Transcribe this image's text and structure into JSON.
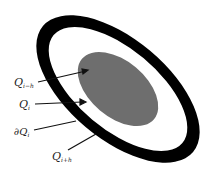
{
  "diagram": {
    "regions": [
      {
        "name": "outer-ring",
        "fill": "#000000",
        "description": "black annulus"
      },
      {
        "name": "white-band",
        "fill": "#ffffff"
      },
      {
        "name": "inner-ellipse",
        "fill": "#6e6e6e"
      }
    ],
    "labels": [
      {
        "id": "q-i-minus-h",
        "base": "Q",
        "sub": "i−h"
      },
      {
        "id": "q-i",
        "base": "Q",
        "sub": "i"
      },
      {
        "id": "boundary-q-i",
        "base": "∂Q",
        "sub": "i"
      },
      {
        "id": "q-i-plus-h",
        "base": "Q",
        "sub": "i+h"
      }
    ]
  }
}
